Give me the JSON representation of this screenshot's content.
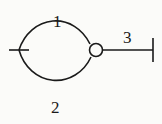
{
  "diagram": {
    "edges": [
      {
        "id": "1",
        "label": "1",
        "kind": "upper-arc"
      },
      {
        "id": "2",
        "label": "2",
        "kind": "lower-arc"
      },
      {
        "id": "3",
        "label": "3",
        "kind": "pendant-line"
      }
    ],
    "nodes": [
      {
        "id": "left-tick",
        "kind": "tick-mark"
      },
      {
        "id": "junction",
        "kind": "open-circle"
      },
      {
        "id": "end",
        "kind": "terminal-bar"
      }
    ],
    "labels": {
      "edge1": "1",
      "edge2": "2",
      "edge3": "3"
    },
    "colors": {
      "ink": "#1a1a1a",
      "paper": "#fbfbf9"
    }
  }
}
